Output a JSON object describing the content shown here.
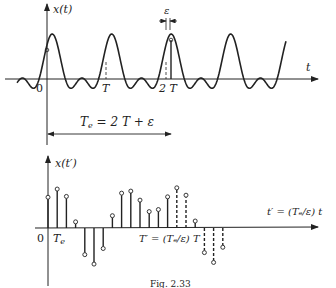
{
  "figure": {
    "top_plot": {
      "y_label": "x(t)",
      "x_label": "t",
      "origin_label": "0",
      "tick_T": "T",
      "tick_2T": "2 T",
      "epsilon_label": "ε",
      "span_label": "Tₑ = 2 T + ε",
      "span_label_main": "T",
      "span_label_sub": "e",
      "span_label_rest": " = 2 T + ε"
    },
    "bottom_plot": {
      "y_label": "x(t′)",
      "x_label": "t′ = (Tₑ/ε) t",
      "origin_label": "0",
      "tick_Te_main": "T",
      "tick_Te_sub": "e",
      "tick_Tprime": "T′ = (Tₑ/ε) T"
    },
    "caption": "Fig. 2.33",
    "colors": {
      "ink": "#222222",
      "background": "#ffffff"
    }
  },
  "chart_data": [
    {
      "type": "line",
      "title": "x(t)",
      "xlabel": "t",
      "ylabel": "x(t)",
      "x_ticks": [
        "0",
        "T",
        "2T"
      ],
      "description": "Periodic waveform with period T (two peaks per period: one tall, one shorter secondary bump); sampled at T_e = 2T + epsilon",
      "annotations": [
        "epsilon",
        "T_e = 2T + epsilon"
      ]
    },
    {
      "type": "stem",
      "title": "x(t')",
      "xlabel": "t' = (T_e/epsilon) t",
      "ylabel": "x(t')",
      "x_ticks": [
        "0",
        "T_e",
        "T' = (T_e/epsilon) T"
      ],
      "samples_index": [
        0,
        1,
        2,
        3,
        4,
        5,
        6,
        7,
        8,
        9,
        10,
        11,
        12,
        13,
        14,
        15,
        16,
        17,
        18,
        19
      ],
      "values": [
        0.75,
        0.95,
        0.77,
        0.15,
        -0.65,
        -0.88,
        -0.5,
        0.3,
        0.85,
        0.9,
        0.68,
        0.4,
        0.45,
        0.76,
        0.98,
        0.8,
        0.17,
        -0.6,
        -0.84,
        -0.47
      ],
      "dashed_from_index": 14
    }
  ]
}
